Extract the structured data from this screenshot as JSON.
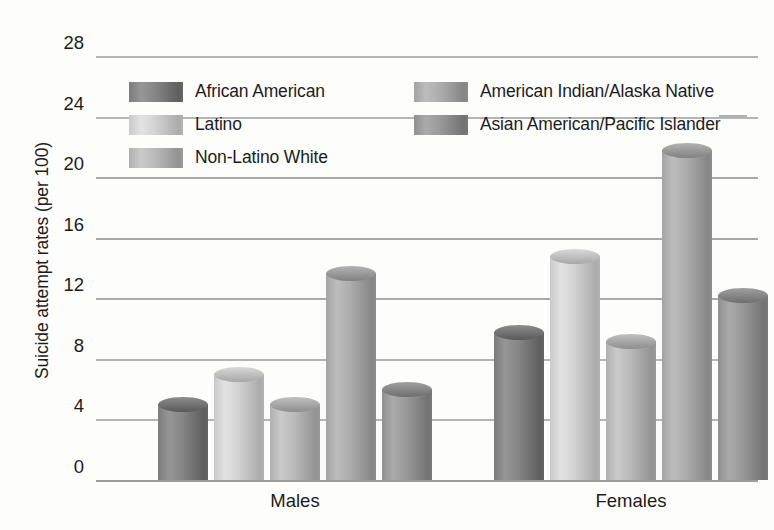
{
  "chart_data": {
    "type": "bar",
    "title": "",
    "xlabel": "",
    "ylabel": "Suicide attempt rates (per 100)",
    "categories": [
      "Males",
      "Females"
    ],
    "ylim": [
      0,
      28
    ],
    "yticks": [
      0,
      4,
      8,
      12,
      16,
      20,
      24,
      28
    ],
    "grid": true,
    "legend_position": "top-inside",
    "series": [
      {
        "name": "African American",
        "values": [
          5,
          9.8
        ],
        "color": "#7c7c7c"
      },
      {
        "name": "Latino",
        "values": [
          7,
          14.8
        ],
        "color": "#c9c9c9"
      },
      {
        "name": "Non-Latino White",
        "values": [
          5,
          9.2
        ],
        "color": "#b0b0b0"
      },
      {
        "name": "American Indian/Alaska Native",
        "values": [
          13.7,
          21.8
        ],
        "color": "#a3a3a3"
      },
      {
        "name": "Asian American/Pacific Islander",
        "values": [
          6,
          12.2
        ],
        "color": "#909090"
      }
    ]
  },
  "axis": {
    "y_title": "Suicide attempt rates (per 100)",
    "ticks": [
      "28",
      "24",
      "20",
      "16",
      "12",
      "8",
      "4",
      "0"
    ]
  },
  "groups": [
    {
      "label": "Males"
    },
    {
      "label": "Females"
    }
  ],
  "legend": {
    "left_column": [
      {
        "label": "African American"
      },
      {
        "label": "Latino"
      },
      {
        "label": "Non-Latino White"
      }
    ],
    "right_column": [
      {
        "label": "American Indian/Alaska Native"
      },
      {
        "label": "Asian American/Pacific Islander"
      }
    ]
  },
  "colors": {
    "grid": "#a9a9a9",
    "text": "#1c1c1c",
    "background": "#fdfdfc"
  }
}
